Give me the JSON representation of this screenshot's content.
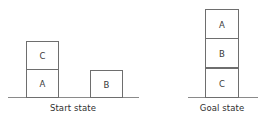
{
  "figure": {
    "background_color": "#ffffff",
    "line_color": "#6e6e6e",
    "ground_color": "#8a8a8a",
    "text_color": "#2f2f2f"
  },
  "scenes": [
    {
      "id": "start",
      "caption": "Start state",
      "ground": {
        "x": 8,
        "y": 97,
        "width": 131
      },
      "caption_pos": {
        "x": 73,
        "y": 104
      },
      "stacks": [
        {
          "id": "stack-left",
          "x": 26,
          "width": 33,
          "blocks": [
            {
              "label": "C",
              "x": 26,
              "y": 41,
              "width": 33,
              "height": 29
            },
            {
              "label": "A",
              "x": 26,
              "y": 69,
              "width": 33,
              "height": 29
            }
          ]
        },
        {
          "id": "stack-right",
          "x": 90,
          "width": 33,
          "blocks": [
            {
              "label": "B",
              "x": 90,
              "y": 70,
              "width": 33,
              "height": 28
            }
          ]
        }
      ]
    },
    {
      "id": "goal",
      "caption": "Goal state",
      "ground": {
        "x": 188,
        "y": 97,
        "width": 70
      },
      "caption_pos": {
        "x": 222,
        "y": 104
      },
      "stacks": [
        {
          "id": "stack-goal",
          "x": 205,
          "width": 34,
          "blocks": [
            {
              "label": "A",
              "x": 205,
              "y": 9,
              "width": 34,
              "height": 30
            },
            {
              "label": "B",
              "x": 205,
              "y": 38,
              "width": 34,
              "height": 30
            },
            {
              "label": "C",
              "x": 205,
              "y": 68,
              "width": 34,
              "height": 30
            }
          ]
        }
      ]
    }
  ]
}
